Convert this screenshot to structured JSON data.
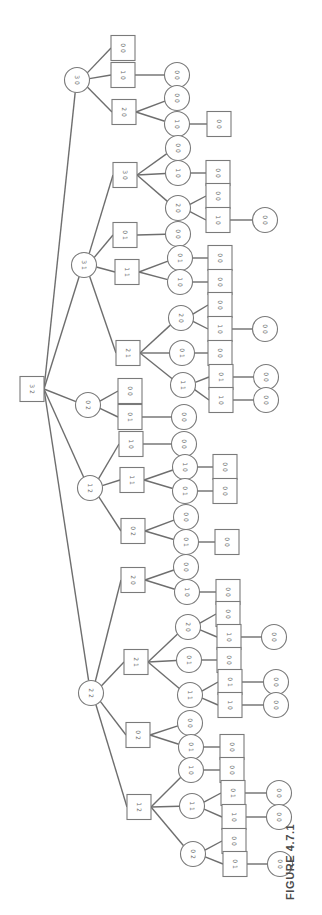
{
  "figure": {
    "caption": "FIGURE 4.7.1",
    "colors": {
      "line": "#6e6e6e",
      "node_stroke": "#7a7a7a",
      "label": "#6a6a6a",
      "caption": "#4a4a4a"
    }
  },
  "tree": {
    "description": "Game tree for two-pile take-away game starting at position (3,2); squares = player I to move, circles = player II to move",
    "nodes": [
      {
        "id": "r",
        "label": "3 2",
        "shape": "square",
        "x": 32,
        "y": 389,
        "parent": null
      },
      {
        "id": "a",
        "label": "3 0",
        "shape": "circle",
        "x": 77,
        "y": 80,
        "parent": "r"
      },
      {
        "id": "a1",
        "label": "0 0",
        "shape": "square",
        "x": 123,
        "y": 48,
        "parent": "a"
      },
      {
        "id": "a2",
        "label": "1 0",
        "shape": "square",
        "x": 123,
        "y": 75,
        "parent": "a"
      },
      {
        "id": "a21",
        "label": "0 0",
        "shape": "circle",
        "x": 177,
        "y": 75,
        "parent": "a2"
      },
      {
        "id": "a3",
        "label": "2 0",
        "shape": "square",
        "x": 124,
        "y": 112,
        "parent": "a"
      },
      {
        "id": "a31",
        "label": "0 0",
        "shape": "circle",
        "x": 177,
        "y": 98,
        "parent": "a3"
      },
      {
        "id": "a32",
        "label": "1 0",
        "shape": "circle",
        "x": 177,
        "y": 124,
        "parent": "a3"
      },
      {
        "id": "a321",
        "label": "0 0",
        "shape": "square",
        "x": 219,
        "y": 124,
        "parent": "a32"
      },
      {
        "id": "b",
        "label": "3 1",
        "shape": "circle",
        "x": 84,
        "y": 265,
        "parent": "r"
      },
      {
        "id": "b1",
        "label": "3 0",
        "shape": "square",
        "x": 125,
        "y": 175,
        "parent": "b"
      },
      {
        "id": "b11",
        "label": "0 0",
        "shape": "circle",
        "x": 178,
        "y": 148,
        "parent": "b1"
      },
      {
        "id": "b12",
        "label": "1 0",
        "shape": "circle",
        "x": 178,
        "y": 173,
        "parent": "b1"
      },
      {
        "id": "b121",
        "label": "0 0",
        "shape": "square",
        "x": 218,
        "y": 173,
        "parent": "b12"
      },
      {
        "id": "b13",
        "label": "2 0",
        "shape": "circle",
        "x": 178,
        "y": 208,
        "parent": "b1"
      },
      {
        "id": "b131",
        "label": "0 0",
        "shape": "square",
        "x": 218,
        "y": 196,
        "parent": "b13"
      },
      {
        "id": "b132",
        "label": "1 0",
        "shape": "square",
        "x": 218,
        "y": 220,
        "parent": "b13"
      },
      {
        "id": "b1321",
        "label": "0 0",
        "shape": "circle",
        "x": 265,
        "y": 220,
        "parent": "b132"
      },
      {
        "id": "b2",
        "label": "0 1",
        "shape": "square",
        "x": 125,
        "y": 235,
        "parent": "b"
      },
      {
        "id": "b21",
        "label": "0 0",
        "shape": "circle",
        "x": 178,
        "y": 234,
        "parent": "b2"
      },
      {
        "id": "b3",
        "label": "1 1",
        "shape": "square",
        "x": 127,
        "y": 272,
        "parent": "b"
      },
      {
        "id": "b31",
        "label": "0 1",
        "shape": "circle",
        "x": 180,
        "y": 258,
        "parent": "b3"
      },
      {
        "id": "b311",
        "label": "0 0",
        "shape": "square",
        "x": 220,
        "y": 258,
        "parent": "b31"
      },
      {
        "id": "b32",
        "label": "1 0",
        "shape": "circle",
        "x": 180,
        "y": 282,
        "parent": "b3"
      },
      {
        "id": "b321",
        "label": "0 0",
        "shape": "square",
        "x": 220,
        "y": 282,
        "parent": "b32"
      },
      {
        "id": "b4",
        "label": "2 1",
        "shape": "square",
        "x": 128,
        "y": 353,
        "parent": "b"
      },
      {
        "id": "b41",
        "label": "2 0",
        "shape": "circle",
        "x": 181,
        "y": 318,
        "parent": "b4"
      },
      {
        "id": "b411",
        "label": "0 0",
        "shape": "square",
        "x": 220,
        "y": 305,
        "parent": "b41"
      },
      {
        "id": "b412",
        "label": "1 0",
        "shape": "square",
        "x": 220,
        "y": 329,
        "parent": "b41"
      },
      {
        "id": "b4121",
        "label": "0 0",
        "shape": "circle",
        "x": 265,
        "y": 329,
        "parent": "b412"
      },
      {
        "id": "b42",
        "label": "0 1",
        "shape": "circle",
        "x": 182,
        "y": 353,
        "parent": "b4"
      },
      {
        "id": "b421",
        "label": "0 0",
        "shape": "square",
        "x": 220,
        "y": 353,
        "parent": "b42"
      },
      {
        "id": "b43",
        "label": "1 1",
        "shape": "circle",
        "x": 183,
        "y": 385,
        "parent": "b4"
      },
      {
        "id": "b431",
        "label": "0 1",
        "shape": "square",
        "x": 221,
        "y": 377,
        "parent": "b43"
      },
      {
        "id": "b4311",
        "label": "0 0",
        "shape": "circle",
        "x": 266,
        "y": 377,
        "parent": "b431"
      },
      {
        "id": "b432",
        "label": "1 0",
        "shape": "square",
        "x": 221,
        "y": 400,
        "parent": "b43"
      },
      {
        "id": "b4321",
        "label": "0 0",
        "shape": "circle",
        "x": 266,
        "y": 400,
        "parent": "b432"
      },
      {
        "id": "c",
        "label": "0 2",
        "shape": "circle",
        "x": 88,
        "y": 405,
        "parent": "r"
      },
      {
        "id": "c1",
        "label": "0 0",
        "shape": "square",
        "x": 130,
        "y": 391,
        "parent": "c"
      },
      {
        "id": "c2",
        "label": "0 1",
        "shape": "square",
        "x": 130,
        "y": 417,
        "parent": "c"
      },
      {
        "id": "c21",
        "label": "0 0",
        "shape": "circle",
        "x": 184,
        "y": 417,
        "parent": "c2"
      },
      {
        "id": "d",
        "label": "1 2",
        "shape": "circle",
        "x": 90,
        "y": 488,
        "parent": "r"
      },
      {
        "id": "d1",
        "label": "1 0",
        "shape": "square",
        "x": 131,
        "y": 444,
        "parent": "d"
      },
      {
        "id": "d11",
        "label": "0 0",
        "shape": "circle",
        "x": 184,
        "y": 444,
        "parent": "d1"
      },
      {
        "id": "d2",
        "label": "1 1",
        "shape": "square",
        "x": 132,
        "y": 480,
        "parent": "d"
      },
      {
        "id": "d21",
        "label": "1 0",
        "shape": "circle",
        "x": 185,
        "y": 467,
        "parent": "d2"
      },
      {
        "id": "d211",
        "label": "0 0",
        "shape": "square",
        "x": 225,
        "y": 467,
        "parent": "d21"
      },
      {
        "id": "d22",
        "label": "0 1",
        "shape": "circle",
        "x": 185,
        "y": 491,
        "parent": "d2"
      },
      {
        "id": "d221",
        "label": "0 0",
        "shape": "square",
        "x": 225,
        "y": 491,
        "parent": "d22"
      },
      {
        "id": "d3",
        "label": "0 2",
        "shape": "square",
        "x": 133,
        "y": 531,
        "parent": "d"
      },
      {
        "id": "d31",
        "label": "0 0",
        "shape": "circle",
        "x": 186,
        "y": 517,
        "parent": "d3"
      },
      {
        "id": "d32",
        "label": "0 1",
        "shape": "circle",
        "x": 186,
        "y": 542,
        "parent": "d3"
      },
      {
        "id": "d321",
        "label": "0 0",
        "shape": "square",
        "x": 227,
        "y": 542,
        "parent": "d32"
      },
      {
        "id": "e",
        "label": "2 2",
        "shape": "circle",
        "x": 91,
        "y": 693,
        "parent": "r"
      },
      {
        "id": "e1",
        "label": "2 0",
        "shape": "square",
        "x": 133,
        "y": 580,
        "parent": "e"
      },
      {
        "id": "e11",
        "label": "0 0",
        "shape": "circle",
        "x": 186,
        "y": 567,
        "parent": "e1"
      },
      {
        "id": "e12",
        "label": "1 0",
        "shape": "circle",
        "x": 187,
        "y": 592,
        "parent": "e1"
      },
      {
        "id": "e121",
        "label": "0 0",
        "shape": "square",
        "x": 228,
        "y": 592,
        "parent": "e12"
      },
      {
        "id": "e2",
        "label": "2 1",
        "shape": "square",
        "x": 136,
        "y": 662,
        "parent": "e"
      },
      {
        "id": "e21",
        "label": "2 0",
        "shape": "circle",
        "x": 188,
        "y": 627,
        "parent": "e2"
      },
      {
        "id": "e211",
        "label": "0 0",
        "shape": "square",
        "x": 228,
        "y": 614,
        "parent": "e21"
      },
      {
        "id": "e212",
        "label": "1 0",
        "shape": "square",
        "x": 229,
        "y": 637,
        "parent": "e21"
      },
      {
        "id": "e2121",
        "label": "0 0",
        "shape": "circle",
        "x": 274,
        "y": 637,
        "parent": "e212"
      },
      {
        "id": "e22",
        "label": "0 1",
        "shape": "circle",
        "x": 189,
        "y": 660,
        "parent": "e2"
      },
      {
        "id": "e221",
        "label": "0 0",
        "shape": "square",
        "x": 229,
        "y": 660,
        "parent": "e22"
      },
      {
        "id": "e23",
        "label": "1 1",
        "shape": "circle",
        "x": 190,
        "y": 695,
        "parent": "e2"
      },
      {
        "id": "e231",
        "label": "0 1",
        "shape": "square",
        "x": 230,
        "y": 682,
        "parent": "e23"
      },
      {
        "id": "e2311",
        "label": "0 0",
        "shape": "circle",
        "x": 276,
        "y": 682,
        "parent": "e231"
      },
      {
        "id": "e232",
        "label": "1 0",
        "shape": "square",
        "x": 230,
        "y": 705,
        "parent": "e23"
      },
      {
        "id": "e2321",
        "label": "0 0",
        "shape": "circle",
        "x": 276,
        "y": 705,
        "parent": "e232"
      },
      {
        "id": "e3",
        "label": "0 2",
        "shape": "square",
        "x": 138,
        "y": 735,
        "parent": "e"
      },
      {
        "id": "e31",
        "label": "0 0",
        "shape": "circle",
        "x": 190,
        "y": 723,
        "parent": "e3"
      },
      {
        "id": "e32",
        "label": "0 1",
        "shape": "circle",
        "x": 191,
        "y": 747,
        "parent": "e3"
      },
      {
        "id": "e321",
        "label": "0 0",
        "shape": "square",
        "x": 232,
        "y": 747,
        "parent": "e32"
      },
      {
        "id": "e4",
        "label": "1 2",
        "shape": "square",
        "x": 139,
        "y": 807,
        "parent": "e"
      },
      {
        "id": "e41",
        "label": "1 0",
        "shape": "circle",
        "x": 191,
        "y": 770,
        "parent": "e4"
      },
      {
        "id": "e411",
        "label": "0 0",
        "shape": "square",
        "x": 232,
        "y": 770,
        "parent": "e41"
      },
      {
        "id": "e42",
        "label": "1 1",
        "shape": "circle",
        "x": 192,
        "y": 806,
        "parent": "e4"
      },
      {
        "id": "e421",
        "label": "0 1",
        "shape": "square",
        "x": 233,
        "y": 793,
        "parent": "e42"
      },
      {
        "id": "e4211",
        "label": "0 0",
        "shape": "circle",
        "x": 279,
        "y": 793,
        "parent": "e421"
      },
      {
        "id": "e422",
        "label": "1 0",
        "shape": "square",
        "x": 234,
        "y": 817,
        "parent": "e42"
      },
      {
        "id": "e4221",
        "label": "0 0",
        "shape": "circle",
        "x": 279,
        "y": 817,
        "parent": "e422"
      },
      {
        "id": "e43",
        "label": "0 2",
        "shape": "circle",
        "x": 193,
        "y": 854,
        "parent": "e4"
      },
      {
        "id": "e431",
        "label": "0 0",
        "shape": "square",
        "x": 234,
        "y": 841,
        "parent": "e43"
      },
      {
        "id": "e432",
        "label": "0 1",
        "shape": "square",
        "x": 235,
        "y": 864,
        "parent": "e43"
      },
      {
        "id": "e4321",
        "label": "0 0",
        "shape": "circle",
        "x": 280,
        "y": 864,
        "parent": "e432"
      }
    ]
  }
}
